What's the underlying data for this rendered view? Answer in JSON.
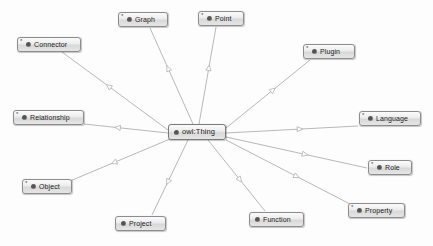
{
  "diagram": {
    "type": "uml-class-hierarchy",
    "background_color": "#fdfdfd",
    "edge_color": "#b0b0b0",
    "node_border_color": "#8c8c8c",
    "node_icon_color": "#555555",
    "label_color": "#1c1c1c",
    "arrow_style": "hollow-triangle-generalization"
  },
  "root": {
    "id": "owl-thing",
    "label": "owl:Thing",
    "marker": "",
    "has_marker": false,
    "x": 168,
    "y": 124,
    "width": 58
  },
  "nodes": [
    {
      "id": "graph",
      "label": "Graph",
      "marker": "*",
      "has_marker": true,
      "x": 118,
      "y": 12,
      "width": 50
    },
    {
      "id": "point",
      "label": "Point",
      "marker": "*",
      "has_marker": true,
      "x": 198,
      "y": 11,
      "width": 46
    },
    {
      "id": "connector",
      "label": "Connector",
      "marker": "*",
      "has_marker": true,
      "x": 17,
      "y": 37,
      "width": 64
    },
    {
      "id": "plugin",
      "label": "Plugin",
      "marker": "*",
      "has_marker": true,
      "x": 303,
      "y": 44,
      "width": 52
    },
    {
      "id": "relationship",
      "label": "Relationship",
      "marker": "*",
      "has_marker": true,
      "x": 13,
      "y": 110,
      "width": 71
    },
    {
      "id": "language",
      "label": "Language",
      "marker": "*",
      "has_marker": true,
      "x": 359,
      "y": 111,
      "width": 62
    },
    {
      "id": "role",
      "label": "Role",
      "marker": "*",
      "has_marker": true,
      "x": 368,
      "y": 160,
      "width": 44
    },
    {
      "id": "object",
      "label": "Object",
      "marker": "*",
      "has_marker": true,
      "x": 22,
      "y": 179,
      "width": 50
    },
    {
      "id": "property",
      "label": "Property",
      "marker": "*",
      "has_marker": true,
      "x": 348,
      "y": 203,
      "width": 57
    },
    {
      "id": "function",
      "label": "Function",
      "marker": "",
      "has_marker": false,
      "x": 249,
      "y": 212,
      "width": 55
    },
    {
      "id": "project",
      "label": "Project",
      "marker": "",
      "has_marker": false,
      "x": 115,
      "y": 216,
      "width": 51
    }
  ],
  "edges": [
    {
      "id": "edge-graph",
      "from": "owl-thing",
      "to": "graph",
      "x1": 193,
      "y1": 124,
      "x2": 150,
      "y2": 28,
      "arrow_t": 0.58
    },
    {
      "id": "edge-point",
      "from": "owl-thing",
      "to": "point",
      "x1": 199,
      "y1": 124,
      "x2": 216,
      "y2": 27,
      "arrow_t": 0.58
    },
    {
      "id": "edge-connector",
      "from": "owl-thing",
      "to": "connector",
      "x1": 168,
      "y1": 130,
      "x2": 62,
      "y2": 52,
      "arrow_t": 0.56
    },
    {
      "id": "edge-plugin",
      "from": "owl-thing",
      "to": "plugin",
      "x1": 226,
      "y1": 128,
      "x2": 310,
      "y2": 60,
      "arrow_t": 0.56
    },
    {
      "id": "edge-relationship",
      "from": "owl-thing",
      "to": "relationship",
      "x1": 168,
      "y1": 133,
      "x2": 84,
      "y2": 124,
      "arrow_t": 0.6
    },
    {
      "id": "edge-language",
      "from": "owl-thing",
      "to": "language",
      "x1": 226,
      "y1": 133,
      "x2": 358,
      "y2": 126,
      "arrow_t": 0.56
    },
    {
      "id": "edge-role",
      "from": "owl-thing",
      "to": "role",
      "x1": 226,
      "y1": 137,
      "x2": 367,
      "y2": 168,
      "arrow_t": 0.56
    },
    {
      "id": "edge-object",
      "from": "owl-thing",
      "to": "object",
      "x1": 170,
      "y1": 139,
      "x2": 70,
      "y2": 181,
      "arrow_t": 0.56
    },
    {
      "id": "edge-property",
      "from": "owl-thing",
      "to": "property",
      "x1": 226,
      "y1": 140,
      "x2": 352,
      "y2": 205,
      "arrow_t": 0.56
    },
    {
      "id": "edge-function",
      "from": "owl-thing",
      "to": "function",
      "x1": 208,
      "y1": 140,
      "x2": 265,
      "y2": 211,
      "arrow_t": 0.56
    },
    {
      "id": "edge-project",
      "from": "owl-thing",
      "to": "project",
      "x1": 188,
      "y1": 140,
      "x2": 152,
      "y2": 215,
      "arrow_t": 0.56
    }
  ]
}
